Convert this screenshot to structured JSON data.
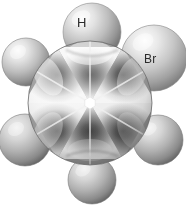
{
  "figure": {
    "kind": "space-filling-molecular-model",
    "projection": "newman-axial-view",
    "background_color": "#ffffff",
    "label_color": "#2b2b2b"
  },
  "labels": {
    "hydrogen": "H",
    "bromine": "Br"
  },
  "core": {
    "name": "ring-core",
    "segment_count": 6,
    "center_x": 90,
    "center_y": 103,
    "radius": 62,
    "hole_radius": 5,
    "hole_color": "#ffffff"
  },
  "substituents": [
    {
      "id": "sub-top",
      "label": "H",
      "cx": 92,
      "cy": 32,
      "r": 29,
      "labelled": true
    },
    {
      "id": "sub-upper-right",
      "label": "Br",
      "cx": 154,
      "cy": 58,
      "r": 33,
      "labelled": true
    },
    {
      "id": "sub-lower-right",
      "label": "",
      "cx": 158,
      "cy": 140,
      "r": 25,
      "labelled": false
    },
    {
      "id": "sub-bottom",
      "label": "",
      "cx": 92,
      "cy": 180,
      "r": 24,
      "labelled": false
    },
    {
      "id": "sub-lower-left",
      "label": "",
      "cx": 25,
      "cy": 140,
      "r": 26,
      "labelled": false
    },
    {
      "id": "sub-upper-left",
      "label": "",
      "cx": 26,
      "cy": 62,
      "r": 24,
      "labelled": false
    }
  ],
  "palette": {
    "sphere_highlight": "#f2f2f2",
    "sphere_mid": "#b8b8b8",
    "sphere_shadow": "#6e6e6e",
    "segment_light": "#ececec",
    "segment_dark": "#4a4a4a",
    "outline": "#5a5a5a"
  }
}
